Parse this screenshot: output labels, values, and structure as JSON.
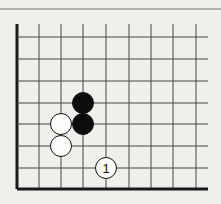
{
  "diagram": {
    "type": "go-board-corner",
    "board": {
      "columns_x": [
        17,
        39,
        61,
        83,
        106,
        129,
        151,
        173,
        196
      ],
      "rows_y": [
        37,
        59,
        81,
        103,
        124,
        146,
        168,
        189
      ],
      "grid_top_y": 24,
      "grid_right_x": 208,
      "edges": [
        "left",
        "bottom"
      ],
      "separator_y": 9
    },
    "stones": [
      {
        "color": "black",
        "col": 3,
        "row": 3,
        "label": ""
      },
      {
        "color": "black",
        "col": 3,
        "row": 4,
        "label": ""
      },
      {
        "color": "white",
        "col": 2,
        "row": 4,
        "label": ""
      },
      {
        "color": "white",
        "col": 2,
        "row": 5,
        "label": ""
      },
      {
        "color": "white",
        "col": 4,
        "row": 6,
        "label": "1"
      }
    ],
    "colors": {
      "background": "#efefec",
      "line": "#444444",
      "edge": "#1a1a1a",
      "black_stone": "#0d0d0d",
      "white_stone": "#fdfdfb"
    }
  }
}
